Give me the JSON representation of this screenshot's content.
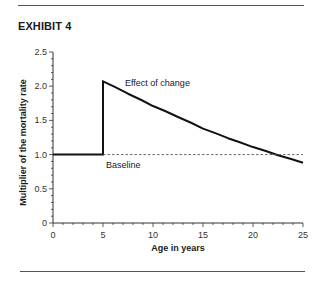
{
  "header": {
    "exhibit_label": "EXHIBIT 4"
  },
  "chart_data": {
    "type": "line",
    "title": "EXHIBIT 4",
    "xlabel": "Age in years",
    "ylabel": "Multiplier of the mortality rate",
    "xlim": [
      0,
      25
    ],
    "ylim": [
      0,
      2.5
    ],
    "x_ticks": [
      "0",
      "5",
      "10",
      "15",
      "20",
      "25"
    ],
    "y_ticks": [
      "0",
      "0.5",
      "1.0",
      "1.5",
      "2.0",
      "2.5"
    ],
    "grid": false,
    "legend": "none",
    "series": [
      {
        "name": "Effect of change",
        "style": "solid",
        "x": [
          0,
          5,
          5,
          7.5,
          10,
          12.5,
          15,
          17.5,
          20,
          22.5,
          25
        ],
        "y": [
          1.0,
          1.0,
          2.07,
          1.89,
          1.71,
          1.55,
          1.38,
          1.24,
          1.11,
          0.99,
          0.88
        ]
      },
      {
        "name": "Baseline",
        "style": "dashed",
        "x": [
          5,
          25
        ],
        "y": [
          1.0,
          1.0
        ]
      }
    ],
    "annotations": [
      {
        "text": "Effect of change",
        "x": 7.2,
        "y": 2.05
      },
      {
        "text": "Baseline",
        "x": 5.3,
        "y": 0.85
      }
    ]
  }
}
